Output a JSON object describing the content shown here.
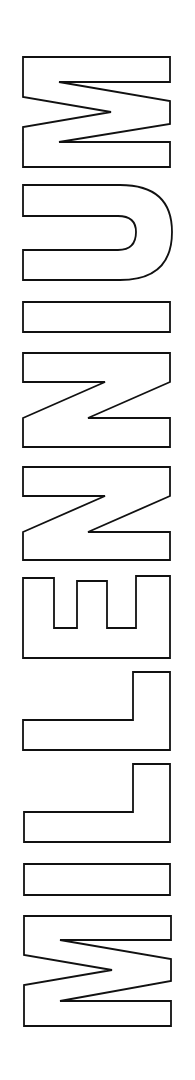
{
  "artwork": {
    "word": "MILLENNIUM",
    "orientation": "rotated 90° counter-clockwise (reads bottom-to-top)",
    "style": "outlined block letters",
    "letters": [
      "M",
      "I",
      "L",
      "L",
      "E",
      "N",
      "N",
      "I",
      "U",
      "M"
    ],
    "colors": {
      "background": "#ffffff",
      "outline": "#111111",
      "fill": "#ffffff"
    }
  }
}
